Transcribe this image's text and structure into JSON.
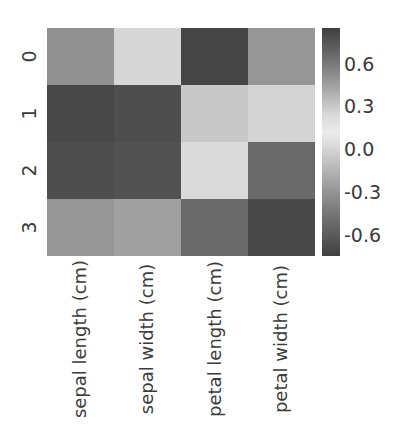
{
  "chart_data": {
    "type": "heatmap",
    "title": "",
    "xlabel": "",
    "ylabel": "",
    "x_tick_labels": [
      "sepal length (cm)",
      "sepal width (cm)",
      "petal length (cm)",
      "petal width (cm)"
    ],
    "y_tick_labels": [
      "0",
      "1",
      "2",
      "3"
    ],
    "rows": [
      {
        "label": "0",
        "values": [
          0.12,
          0.55,
          -0.58,
          0.08
        ]
      },
      {
        "label": "1",
        "values": [
          -0.58,
          -0.54,
          0.44,
          0.48
        ]
      },
      {
        "label": "2",
        "values": [
          -0.52,
          -0.5,
          0.57,
          -0.25
        ]
      },
      {
        "label": "3",
        "values": [
          0.1,
          0.18,
          -0.26,
          -0.57
        ]
      }
    ],
    "cell_colors": [
      [
        "#919191",
        "#d7d7d7",
        "#464646",
        "#969696"
      ],
      [
        "#484848",
        "#4e4e4e",
        "#c8c8c8",
        "#d4d4d4"
      ],
      [
        "#4e4e4e",
        "#525252",
        "#dadada",
        "#696969"
      ],
      [
        "#969696",
        "#a0a0a0",
        "#696969",
        "#484848"
      ]
    ],
    "colorbar": {
      "orientation": "vertical",
      "tick_labels": [
        "0.6",
        "0.3",
        "0.0",
        "-0.3",
        "-0.6"
      ],
      "tick_values": [
        0.6,
        0.3,
        0.0,
        -0.3,
        -0.6
      ],
      "vmin": -0.75,
      "vmax": 0.85,
      "gradient_stops": [
        {
          "pos": "0%",
          "color": "#3f3f3f"
        },
        {
          "pos": "12%",
          "color": "#6a6a6a"
        },
        {
          "pos": "26%",
          "color": "#a3a3a3"
        },
        {
          "pos": "38%",
          "color": "#d9d9d9"
        },
        {
          "pos": "46%",
          "color": "#ebebeb"
        },
        {
          "pos": "54%",
          "color": "#d2d2d2"
        },
        {
          "pos": "66%",
          "color": "#a8a8a8"
        },
        {
          "pos": "80%",
          "color": "#7a7a7a"
        },
        {
          "pos": "100%",
          "color": "#404040"
        }
      ]
    },
    "grid": false,
    "legend_position": "right",
    "background_color": "#ffffff",
    "text_color": "#3b3b3b"
  }
}
